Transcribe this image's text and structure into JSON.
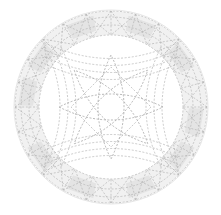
{
  "diagram": {
    "type": "circular-geometric-pattern",
    "center": [
      111,
      107
    ],
    "outer_radius": 96,
    "ring_radii": [
      96,
      90,
      82,
      72
    ],
    "colors": {
      "background": "#ffffff",
      "line": "#b4b4b4",
      "line_dark": "#9a9a9a",
      "band_fill": "#f1f1f1",
      "patch_fill": "#e4e4e4"
    },
    "petal_count": 4,
    "patch_angles_deg": [
      -110,
      -70,
      -35,
      10,
      35,
      70,
      110,
      145,
      190,
      215,
      250,
      290
    ],
    "radial_line_count": 24
  }
}
